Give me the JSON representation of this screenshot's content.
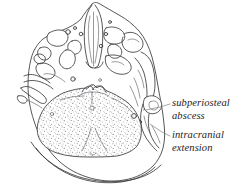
{
  "figure": {
    "kind": "anatomical-line-drawing",
    "view": "axial skull base",
    "background_color": "#ffffff",
    "ink_color": "#3a3a3c",
    "stipple_color": "#7a7a80",
    "leader_color": "#6a6a70",
    "width": 246,
    "height": 189
  },
  "labels": {
    "subperiosteal_abscess": {
      "line1": "subperiosteal",
      "line2": "abscess"
    },
    "intracranial_extension": {
      "line1": "intracranial",
      "line2": "extension"
    }
  },
  "regions": {
    "posterior_fossa_stippled": "stippled posterior cranial fossa",
    "nasal_cavity": "nasal cavity and septum",
    "maxillary_sinus_left": "left maxillary sinus",
    "maxillary_sinus_right": "right maxillary sinus",
    "mastoid_right": "right mastoid region",
    "occipital_outline": "occipital bone outline"
  }
}
